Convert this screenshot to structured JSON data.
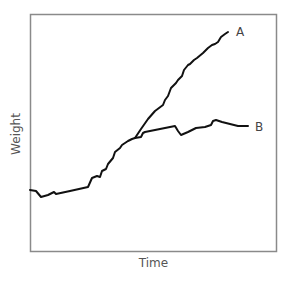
{
  "chart_data": {
    "type": "line",
    "title": "",
    "xlabel": "Time",
    "ylabel": "Weight",
    "grid": false,
    "legend": "inline labels at line ends",
    "frame": {
      "left": 30,
      "top": 14,
      "right": 277,
      "bottom": 252
    },
    "shared_segment": {
      "name": "common",
      "points": [
        [
          30,
          190
        ],
        [
          36,
          191
        ],
        [
          41,
          197
        ],
        [
          48,
          195
        ],
        [
          54,
          192
        ],
        [
          56,
          194
        ],
        [
          70,
          191
        ],
        [
          88,
          187
        ],
        [
          92,
          178
        ],
        [
          97,
          176
        ],
        [
          100,
          177
        ],
        [
          102,
          171
        ],
        [
          106,
          169
        ],
        [
          108,
          164
        ],
        [
          113,
          158
        ],
        [
          115,
          152
        ],
        [
          120,
          148
        ],
        [
          122,
          145
        ],
        [
          125,
          143
        ],
        [
          128,
          141
        ],
        [
          132,
          139
        ],
        [
          135,
          138
        ]
      ]
    },
    "series": [
      {
        "name": "A",
        "color": "#111111",
        "points": [
          [
            135,
            138
          ],
          [
            141,
            129
          ],
          [
            148,
            119
          ],
          [
            155,
            111
          ],
          [
            163,
            105
          ],
          [
            165,
            100
          ],
          [
            168,
            96
          ],
          [
            171,
            88
          ],
          [
            174,
            85
          ],
          [
            176,
            83
          ],
          [
            178,
            80
          ],
          [
            182,
            76
          ],
          [
            184,
            70
          ],
          [
            188,
            65
          ],
          [
            190,
            64
          ],
          [
            194,
            60
          ],
          [
            197,
            58
          ],
          [
            203,
            53
          ],
          [
            208,
            48
          ],
          [
            212,
            45
          ],
          [
            215,
            44
          ],
          [
            218,
            42
          ],
          [
            221,
            37
          ],
          [
            225,
            34
          ],
          [
            228,
            32
          ]
        ],
        "label_pos": [
          236,
          33
        ]
      },
      {
        "name": "B",
        "color": "#111111",
        "points": [
          [
            135,
            138
          ],
          [
            141,
            137
          ],
          [
            143,
            133
          ],
          [
            145,
            132
          ],
          [
            160,
            129
          ],
          [
            175,
            126
          ],
          [
            178,
            131
          ],
          [
            181,
            135
          ],
          [
            188,
            132
          ],
          [
            196,
            128
          ],
          [
            205,
            127
          ],
          [
            211,
            125
          ],
          [
            213,
            121
          ],
          [
            216,
            120
          ],
          [
            222,
            122
          ],
          [
            230,
            124
          ],
          [
            238,
            126
          ],
          [
            248,
            126
          ]
        ],
        "label_pos": [
          255,
          128
        ]
      }
    ],
    "xlim": null,
    "ylim": null
  },
  "labels": {
    "x_axis": "Time",
    "y_axis": "Weight",
    "series_a": "A",
    "series_b": "B"
  }
}
